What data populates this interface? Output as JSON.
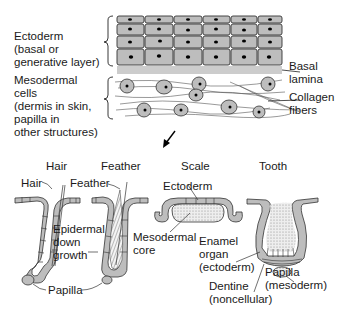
{
  "top_panel": {
    "ectoderm_label": [
      "Ectoderm",
      "(basal or",
      "generative layer)"
    ],
    "mesoderm_label": [
      "Mesodermal",
      "cells",
      "(dermis in skin,",
      "papilla in",
      "other structures)"
    ],
    "basal_lamina_label": [
      "Basal",
      "lamina"
    ],
    "collagen_label": [
      "Collagen",
      "fibers"
    ]
  },
  "structures": [
    {
      "title": "Hair"
    },
    {
      "title": "Feather"
    },
    {
      "title": "Scale"
    },
    {
      "title": "Tooth"
    }
  ],
  "bottom_labels": {
    "hair": "Hair",
    "feather": "Feather",
    "ectoderm": "Ectoderm",
    "epidermal_down_growth": [
      "Epidermal",
      "down",
      "growth"
    ],
    "mesodermal_core": [
      "Mesodermal",
      "core"
    ],
    "enamel_organ": [
      "Enamel",
      "organ",
      "(ectoderm)"
    ],
    "papilla_shared": "Papilla",
    "tooth_papilla": [
      "Papilla",
      "(mesoderm)"
    ],
    "dentine": [
      "Dentine",
      "(noncellular)"
    ]
  },
  "colors": {
    "cell_fill": "#bdbdbd",
    "outline": "#1a1a1a",
    "nucleus": "#000000",
    "background": "#ffffff"
  }
}
